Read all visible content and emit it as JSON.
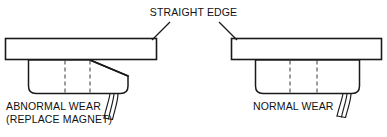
{
  "diagram": {
    "title": "STRAIGHT EDGE",
    "panels": [
      {
        "id": "left",
        "label_line1": "ABNORMAL WEAR",
        "label_line2": "(REPLACE MAGNET)",
        "condition": "abnormal",
        "straight_edge_name": "straight-edge-bar",
        "magnet_name": "magnet-body",
        "wear_description": "tapered magnet face, gap under straight edge"
      },
      {
        "id": "right",
        "label_line1": "NORMAL WEAR",
        "label_line2": "",
        "condition": "normal",
        "straight_edge_name": "straight-edge-bar",
        "magnet_name": "magnet-body",
        "wear_description": "flat magnet face, full contact with straight edge"
      }
    ],
    "colors": {
      "line": "#1a1a1a",
      "dashed": "#4a4a4a",
      "text": "#111111",
      "background": "#ffffff"
    }
  }
}
